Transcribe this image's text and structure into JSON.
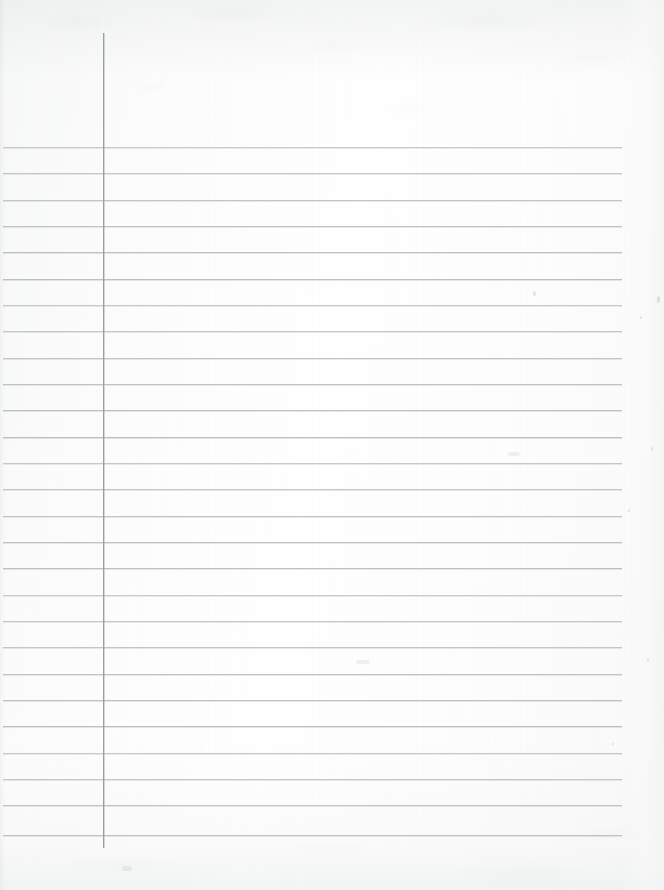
{
  "document": {
    "type": "scanned-lined-notebook-paper",
    "title": "Blank lined notebook page",
    "orientation": "portrait",
    "page_width": 664,
    "page_height": 890,
    "background_color": "#fdfdfd",
    "content_text": "",
    "has_handwriting": false,
    "has_printed_text": false
  },
  "ruling": {
    "rule_color": "#b9bcbd",
    "rule_thickness": 1,
    "line_count": 27,
    "line_spacing": 26.5,
    "first_line_y": 147,
    "last_line_y": 835,
    "rule_start_x": 3,
    "rule_end_x": 622,
    "line_y_positions": [
      147,
      173,
      200,
      226,
      252,
      279,
      305,
      331,
      358,
      384,
      410,
      437,
      463,
      489,
      516,
      542,
      568,
      595,
      621,
      647,
      674,
      700,
      726,
      753,
      779,
      805,
      835
    ]
  },
  "margin_rule": {
    "label": "vertical margin line",
    "color": "#9a9e9f",
    "thickness": 1,
    "x": 103,
    "top_y": 33,
    "bottom_y": 848
  },
  "header_area": {
    "label": "unruled header space above first line",
    "top_y": 0,
    "bottom_y": 147
  },
  "footer_area": {
    "label": "unruled footer space below last line",
    "top_y": 835,
    "bottom_y": 890
  },
  "right_margin": {
    "label": "unruled right margin strip",
    "start_x": 622,
    "end_x": 664
  },
  "writing_area": {
    "label": "blank writing area right of margin rule",
    "left_x": 104,
    "right_x": 622,
    "top_y": 147,
    "bottom_y": 835
  },
  "artifacts": {
    "specks": [
      {
        "x": 533,
        "y": 291,
        "w": 3,
        "h": 5
      },
      {
        "x": 657,
        "y": 296,
        "w": 3,
        "h": 7
      },
      {
        "x": 640,
        "y": 316,
        "w": 2,
        "h": 3
      },
      {
        "x": 651,
        "y": 447,
        "w": 2,
        "h": 4
      },
      {
        "x": 628,
        "y": 509,
        "w": 2,
        "h": 3
      },
      {
        "x": 647,
        "y": 658,
        "w": 2,
        "h": 3
      },
      {
        "x": 612,
        "y": 743,
        "w": 2,
        "h": 2
      }
    ],
    "smudges": [
      {
        "x": 122,
        "y": 866,
        "w": 10,
        "h": 5
      },
      {
        "x": 356,
        "y": 660,
        "w": 14,
        "h": 4
      },
      {
        "x": 508,
        "y": 452,
        "w": 12,
        "h": 4
      }
    ]
  }
}
